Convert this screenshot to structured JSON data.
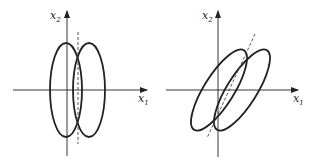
{
  "figure": {
    "panels": [
      {
        "id": "left",
        "description": "Two vertical ellipses side by side, overlapping, with dashed vertical line through intersection",
        "x_axis_label": "x",
        "x_axis_sub": "1",
        "y_axis_label": "x",
        "y_axis_sub": "2"
      },
      {
        "id": "right",
        "description": "Two tilted ellipses overlapping, with dashed slanted line through intersection",
        "x_axis_label": "x",
        "x_axis_sub": "1",
        "y_axis_label": "x",
        "y_axis_sub": "2"
      }
    ],
    "colors": {
      "stroke": "#222222",
      "background": "#ffffff"
    }
  }
}
